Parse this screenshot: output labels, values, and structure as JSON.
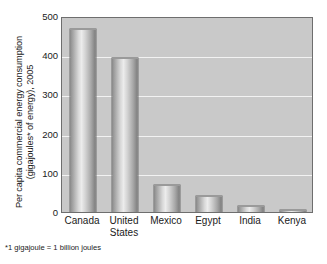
{
  "chart_data": {
    "type": "bar",
    "title": "",
    "subtitle": "",
    "xlabel": "",
    "ylabel": "Per capita commercial energy consumption (gigajoules* of energy), 2005",
    "ylabel_line1": "Per capita commercial energy consumption",
    "ylabel_line2": "(gigajoules* of energy), 2005",
    "categories": [
      "Canada",
      "United States",
      "Mexico",
      "Egypt",
      "India",
      "Kenya"
    ],
    "category_display": [
      "Canada",
      "United\nStates",
      "Mexico",
      "Egypt",
      "India",
      "Kenya"
    ],
    "values": [
      468,
      392,
      70,
      40,
      15,
      5
    ],
    "ylim": [
      0,
      500
    ],
    "yticks": [
      0,
      100,
      200,
      300,
      400,
      500
    ],
    "ytick_labels": [
      "0",
      "100",
      "200",
      "300",
      "400",
      "500"
    ],
    "gridlines": [
      100,
      200,
      300,
      400
    ],
    "grid": true,
    "legend": null,
    "legend_position": "none",
    "footnote": "*1 gigajoule = 1 billion joules",
    "units": "gigajoules per capita",
    "colors": {
      "plot_background": "#c9c9c9",
      "gridline": "#f2f2f2",
      "bar_light": "#ececec",
      "bar_dark": "#7e7e7e",
      "axis_border": "#6e6e6e",
      "text": "#1a1a1a",
      "page_background": "#ffffff"
    }
  }
}
